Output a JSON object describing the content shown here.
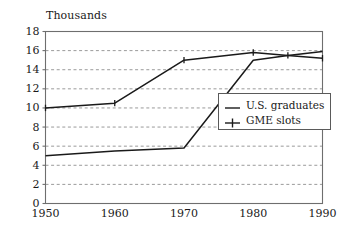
{
  "chart_data": {
    "type": "line",
    "title": "Thousands",
    "xlabel": "",
    "ylabel": "",
    "xlim": [
      1950,
      1990
    ],
    "ylim": [
      0,
      18
    ],
    "grid": true,
    "grid_axis": "y",
    "legend_position": "center-right",
    "x": [
      1950,
      1960,
      1970,
      1980,
      1985,
      1990
    ],
    "categories": [
      "1950",
      "1960",
      "1970",
      "1980",
      "1990"
    ],
    "xticks": [
      1950,
      1960,
      1970,
      1980,
      1990
    ],
    "xtick_labels": [
      "1950",
      "1960",
      "1970",
      "1980",
      "1990"
    ],
    "yticks": [
      0,
      2,
      4,
      6,
      8,
      10,
      12,
      14,
      16,
      18
    ],
    "ytick_labels": [
      "0",
      "2",
      "4",
      "6",
      "8",
      "10",
      "12",
      "14",
      "16",
      "18"
    ],
    "series": [
      {
        "name": "U.S. graduates",
        "marker": "none",
        "color": "#1a1a1a",
        "x": [
          1950,
          1960,
          1970,
          1980,
          1985,
          1990
        ],
        "values": [
          5.0,
          5.5,
          5.8,
          15.0,
          15.5,
          15.9
        ]
      },
      {
        "name": "GME slots",
        "marker": "plus",
        "color": "#1a1a1a",
        "x": [
          1950,
          1960,
          1970,
          1980,
          1985,
          1990
        ],
        "values": [
          10.0,
          10.5,
          15.0,
          15.8,
          15.5,
          15.2
        ]
      }
    ]
  },
  "legend": {
    "entries": [
      {
        "label": "U.S. graduates",
        "marker": "none"
      },
      {
        "label": "GME slots",
        "marker": "plus"
      }
    ]
  }
}
